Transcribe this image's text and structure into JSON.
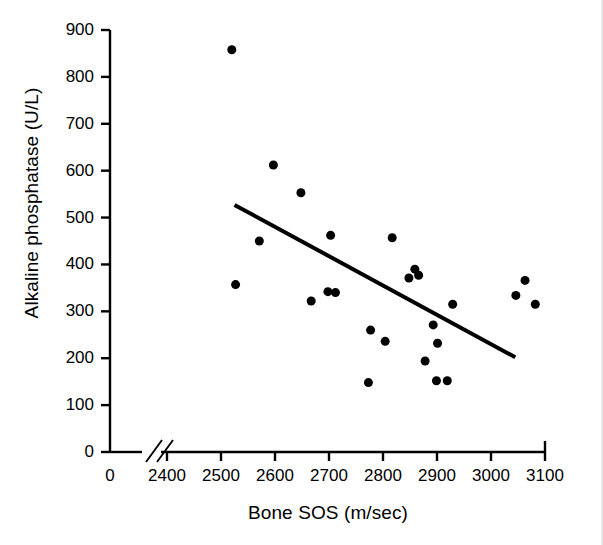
{
  "chart_data": {
    "type": "scatter",
    "title": "",
    "xlabel": "Bone SOS (m/sec)",
    "ylabel": "Alkaline phosphatase (U/L)",
    "xlim": [
      2400,
      3100
    ],
    "ylim": [
      0,
      900
    ],
    "xticks": [
      0,
      2400,
      2500,
      2600,
      2700,
      2800,
      2900,
      3000,
      3100
    ],
    "yticks": [
      0,
      100,
      200,
      300,
      400,
      500,
      600,
      700,
      800,
      900
    ],
    "xtick_labels": [
      "0",
      "2400",
      "2500",
      "2600",
      "2700",
      "2800",
      "2900",
      "3000",
      "3100"
    ],
    "ytick_labels": [
      "0",
      "100",
      "200",
      "300",
      "400",
      "500",
      "600",
      "700",
      "800",
      "900"
    ],
    "axis_break": true,
    "axis_break_note": "x-axis broken between 0 and 2400",
    "grid": false,
    "legend": null,
    "marker_color": "#000000",
    "marker_size": 9,
    "points": [
      {
        "x": 2520,
        "y": 858
      },
      {
        "x": 2597,
        "y": 612
      },
      {
        "x": 2648,
        "y": 553
      },
      {
        "x": 2703,
        "y": 462
      },
      {
        "x": 2571,
        "y": 450
      },
      {
        "x": 2817,
        "y": 457
      },
      {
        "x": 2859,
        "y": 390
      },
      {
        "x": 2866,
        "y": 377
      },
      {
        "x": 2848,
        "y": 371
      },
      {
        "x": 3063,
        "y": 366
      },
      {
        "x": 2527,
        "y": 357
      },
      {
        "x": 3046,
        "y": 334
      },
      {
        "x": 2698,
        "y": 342
      },
      {
        "x": 2712,
        "y": 340
      },
      {
        "x": 2667,
        "y": 322
      },
      {
        "x": 2929,
        "y": 315
      },
      {
        "x": 3082,
        "y": 315
      },
      {
        "x": 2893,
        "y": 271
      },
      {
        "x": 2777,
        "y": 260
      },
      {
        "x": 2804,
        "y": 236
      },
      {
        "x": 2901,
        "y": 232
      },
      {
        "x": 2878,
        "y": 194
      },
      {
        "x": 2899,
        "y": 152
      },
      {
        "x": 2919,
        "y": 152
      },
      {
        "x": 2773,
        "y": 148
      }
    ],
    "trendline": {
      "type": "linear-fit",
      "x_start": 2525,
      "y_start": 527,
      "x_end": 3045,
      "y_end": 202,
      "color": "#000000",
      "width": 4
    }
  }
}
